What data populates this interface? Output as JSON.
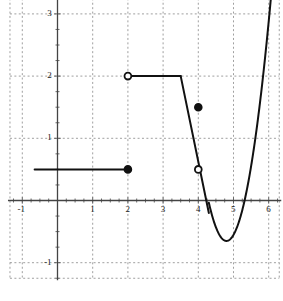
{
  "chart_data": {
    "type": "line",
    "title": "",
    "xlabel": "",
    "ylabel": "",
    "xlim": [
      -1.35,
      6.3
    ],
    "ylim": [
      -1.25,
      3.25
    ],
    "grid": true,
    "grid_style": "dashed",
    "legend": false,
    "xticks": [
      -1,
      1,
      2,
      3,
      4,
      5,
      6
    ],
    "xtick_labels": [
      "-1",
      "1",
      "2",
      "3",
      "4",
      "5",
      "6"
    ],
    "yticks": [
      -1,
      1,
      2,
      3
    ],
    "ytick_labels": [
      "-1",
      "1",
      "2",
      "3"
    ],
    "minor_tick_step": 0.25,
    "series": [
      {
        "name": "constant-ray-left",
        "kind": "segment",
        "y": 0.5,
        "x_start": -0.65,
        "x_end": 2.0
      },
      {
        "name": "constant-segment-mid",
        "kind": "segment",
        "y": 2.0,
        "x_start": 2.0,
        "x_end": 3.5
      },
      {
        "name": "falling-line",
        "kind": "segment",
        "x_start": 3.5,
        "y_start": 2.0,
        "x_end": 4.3,
        "y_end": -0.2
      },
      {
        "name": "parabola",
        "kind": "curve",
        "vertex": [
          4.8,
          -0.65
        ],
        "a": 2.45,
        "x_start": 4.3,
        "x_end": 6.08
      }
    ],
    "points": [
      {
        "name": "open-point-2-2",
        "x": 2.0,
        "y": 2.0,
        "fill": "open"
      },
      {
        "name": "closed-point-2-05",
        "x": 2.0,
        "y": 0.5,
        "fill": "closed"
      },
      {
        "name": "closed-point-4-15",
        "x": 4.0,
        "y": 1.5,
        "fill": "closed"
      },
      {
        "name": "open-point-4-05",
        "x": 4.0,
        "y": 0.5,
        "fill": "open"
      }
    ]
  },
  "colors": {
    "curve": "#111111",
    "axis": "#444444",
    "grid": "#888888",
    "background": "#ffffff",
    "label": "#1a1a1a"
  }
}
